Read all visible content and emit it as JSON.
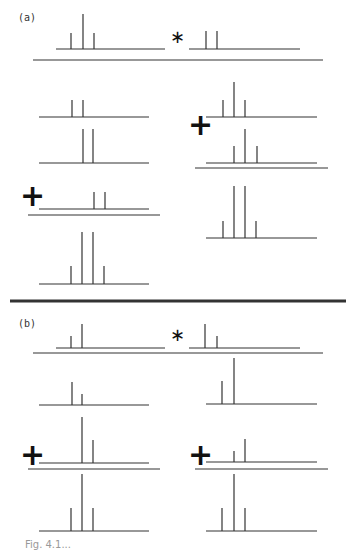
{
  "figure": {
    "width": 353,
    "height": 545,
    "stroke_color": "#333333",
    "divider": {
      "x1": 10,
      "x2": 346,
      "y": 301,
      "width": 3
    },
    "caption": "Fig. 4.1..."
  },
  "panels": [
    {
      "label": "(a)",
      "label_pos": [
        18,
        12
      ],
      "operators": [
        {
          "type": "star",
          "symbol": "∗",
          "x": 170,
          "y": 28
        },
        {
          "type": "plus",
          "symbol": "+",
          "x": 188,
          "y": 110
        },
        {
          "type": "plus",
          "symbol": "+",
          "x": 20,
          "y": 181
        }
      ],
      "sum_lines": [
        {
          "x1": 33,
          "x2": 323,
          "y": 60
        },
        {
          "x1": 195,
          "x2": 328,
          "y": 168
        },
        {
          "x1": 28,
          "x2": 160,
          "y": 215
        }
      ],
      "spectra": [
        {
          "name": "input-left",
          "x1": 56,
          "x2": 165,
          "y": 49,
          "peaks": [
            [
              71,
              16
            ],
            [
              83,
              35
            ],
            [
              94,
              16
            ]
          ]
        },
        {
          "name": "input-right",
          "x1": 189,
          "x2": 300,
          "y": 49,
          "peaks": [
            [
              206,
              18
            ],
            [
              217,
              18
            ]
          ]
        },
        {
          "name": "left-1",
          "x1": 39,
          "x2": 149,
          "y": 117,
          "peaks": [
            [
              72,
              17
            ],
            [
              83,
              17
            ]
          ]
        },
        {
          "name": "left-2",
          "x1": 39,
          "x2": 149,
          "y": 163,
          "peaks": [
            [
              83,
              34
            ],
            [
              93,
              34
            ]
          ]
        },
        {
          "name": "left-3",
          "x1": 39,
          "x2": 149,
          "y": 209,
          "peaks": [
            [
              94,
              17
            ],
            [
              105,
              17
            ]
          ]
        },
        {
          "name": "left-result",
          "x1": 39,
          "x2": 149,
          "y": 284,
          "peaks": [
            [
              71,
              18
            ],
            [
              82,
              52
            ],
            [
              93,
              52
            ],
            [
              104,
              18
            ]
          ]
        },
        {
          "name": "right-1",
          "x1": 206,
          "x2": 317,
          "y": 117,
          "peaks": [
            [
              223,
              17
            ],
            [
              234,
              35
            ],
            [
              245,
              17
            ]
          ]
        },
        {
          "name": "right-2",
          "x1": 206,
          "x2": 317,
          "y": 163,
          "peaks": [
            [
              234,
              17
            ],
            [
              245,
              34
            ],
            [
              257,
              17
            ]
          ]
        },
        {
          "name": "right-result",
          "x1": 206,
          "x2": 317,
          "y": 238,
          "peaks": [
            [
              223,
              17
            ],
            [
              234,
              52
            ],
            [
              245,
              52
            ],
            [
              256,
              17
            ]
          ]
        }
      ]
    },
    {
      "label": "(b)",
      "label_pos": [
        18,
        318
      ],
      "operators": [
        {
          "type": "star",
          "symbol": "∗",
          "x": 170,
          "y": 326
        },
        {
          "type": "plus",
          "symbol": "+",
          "x": 20,
          "y": 440
        },
        {
          "type": "plus",
          "symbol": "+",
          "x": 188,
          "y": 440
        }
      ],
      "sum_lines": [
        {
          "x1": 33,
          "x2": 323,
          "y": 353
        },
        {
          "x1": 28,
          "x2": 160,
          "y": 469
        },
        {
          "x1": 195,
          "x2": 328,
          "y": 469
        }
      ],
      "spectra": [
        {
          "name": "input-left",
          "x1": 56,
          "x2": 165,
          "y": 348,
          "peaks": [
            [
              71,
              12
            ],
            [
              82,
              24
            ]
          ]
        },
        {
          "name": "input-right",
          "x1": 189,
          "x2": 300,
          "y": 348,
          "peaks": [
            [
              205,
              24
            ],
            [
              217,
              12
            ]
          ]
        },
        {
          "name": "left-1",
          "x1": 39,
          "x2": 149,
          "y": 405,
          "peaks": [
            [
              72,
              23
            ],
            [
              82,
              11
            ]
          ]
        },
        {
          "name": "left-2",
          "x1": 39,
          "x2": 149,
          "y": 463,
          "peaks": [
            [
              82,
              46
            ],
            [
              93,
              23
            ]
          ]
        },
        {
          "name": "left-result",
          "x1": 39,
          "x2": 149,
          "y": 531,
          "peaks": [
            [
              71,
              23
            ],
            [
              82,
              57
            ],
            [
              93,
              23
            ]
          ]
        },
        {
          "name": "right-1",
          "x1": 206,
          "x2": 317,
          "y": 404,
          "peaks": [
            [
              222,
              23
            ],
            [
              234,
              46
            ]
          ]
        },
        {
          "name": "right-2",
          "x1": 206,
          "x2": 317,
          "y": 462,
          "peaks": [
            [
              234,
              11
            ],
            [
              245,
              23
            ]
          ]
        },
        {
          "name": "right-result",
          "x1": 206,
          "x2": 317,
          "y": 531,
          "peaks": [
            [
              222,
              23
            ],
            [
              234,
              57
            ],
            [
              245,
              23
            ]
          ]
        }
      ]
    }
  ]
}
